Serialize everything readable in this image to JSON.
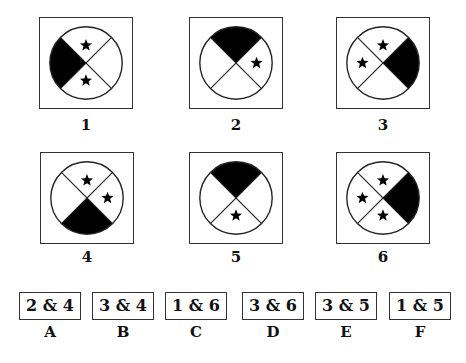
{
  "figures": [
    {
      "label": "1",
      "shaded": "left",
      "stars": [
        "top",
        "bottom"
      ]
    },
    {
      "label": "2",
      "shaded": "top",
      "stars": [
        "right"
      ]
    },
    {
      "label": "3",
      "shaded": "right",
      "stars": [
        "top",
        "left"
      ]
    },
    {
      "label": "4",
      "shaded": "bottom",
      "stars": [
        "top",
        "right"
      ]
    },
    {
      "label": "5",
      "shaded": "top",
      "stars": [
        "bottom"
      ]
    },
    {
      "label": "6",
      "shaded": "right",
      "stars": [
        "top",
        "left",
        "bottom"
      ]
    }
  ],
  "options": [
    {
      "letter": "A",
      "text": "2 & 4"
    },
    {
      "letter": "B",
      "text": "3 & 4"
    },
    {
      "letter": "C",
      "text": "1 & 6"
    },
    {
      "letter": "D",
      "text": "3 & 6"
    },
    {
      "letter": "E",
      "text": "3 & 5"
    },
    {
      "letter": "F",
      "text": "1 & 5"
    }
  ],
  "colors": {
    "shade": "#000000",
    "line": "#222222",
    "background": "#ffffff"
  }
}
